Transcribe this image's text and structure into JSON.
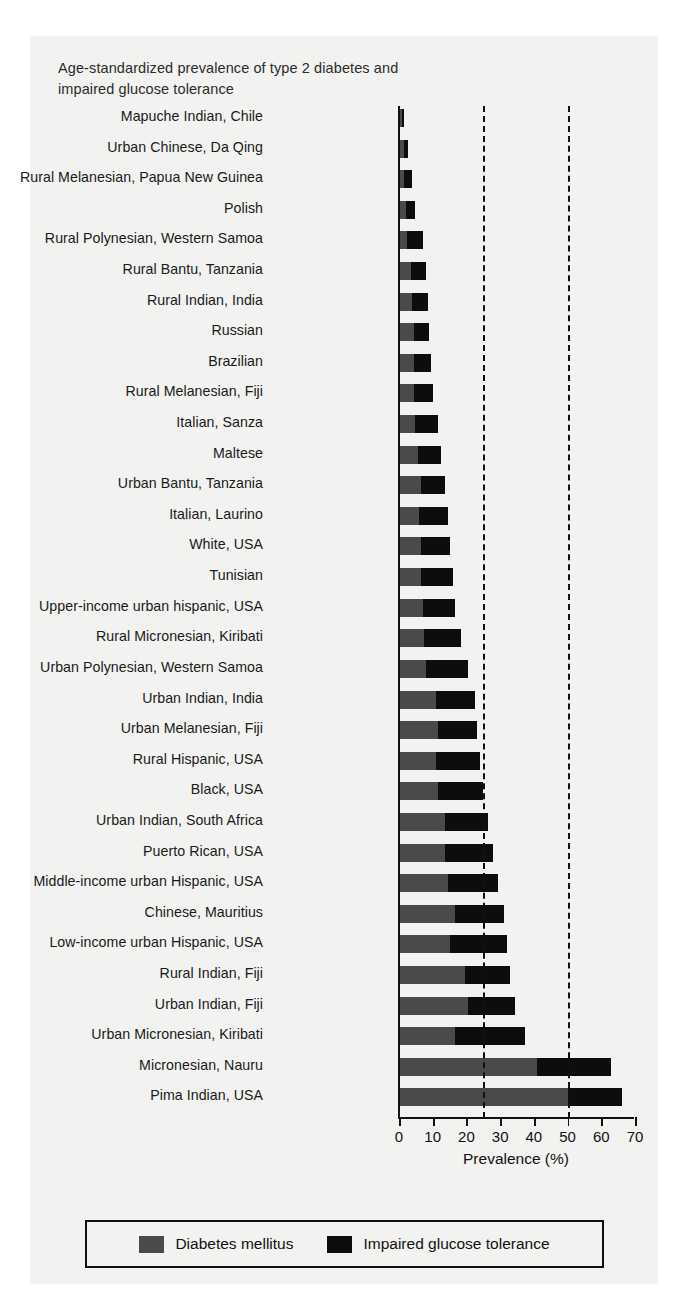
{
  "figure": {
    "title": "Age-standardized prevalence of type 2 diabetes and impaired glucose tolerance",
    "title_line1": "Age-standardized prevalence of type 2 diabetes and",
    "title_line2": "impaired glucose tolerance"
  },
  "legend": {
    "items": [
      {
        "label": "Diabetes mellitus",
        "color": "#4a4a4a",
        "swatch": "diabetes-swatch"
      },
      {
        "label": "Impaired glucose tolerance",
        "color": "#0d0d0d",
        "swatch": "igt-swatch"
      }
    ]
  },
  "chart_data": {
    "type": "bar",
    "orientation": "horizontal",
    "stacked": true,
    "title": "Age-standardized prevalence of type 2 diabetes and impaired glucose tolerance",
    "xlabel": "Prevalence (%)",
    "ylabel": "",
    "xlim": [
      0,
      70
    ],
    "xticks": [
      0,
      10,
      20,
      30,
      40,
      50,
      60,
      70
    ],
    "xtick_labels": [
      "0",
      "10",
      "20",
      "30",
      "40",
      "50",
      "60",
      "70"
    ],
    "grid": false,
    "reference_lines": [
      {
        "value": 25,
        "style": "dashed",
        "color": "#111111"
      },
      {
        "value": 50,
        "style": "dashed",
        "color": "#111111"
      }
    ],
    "legend_position": "bottom",
    "categories": [
      "Mapuche Indian, Chile",
      "Urban Chinese, Da Qing",
      "Rural Melanesian, Papua New Guinea",
      "Polish",
      "Rural Polynesian, Western Samoa",
      "Rural Bantu, Tanzania",
      "Rural Indian, India",
      "Russian",
      "Brazilian",
      "Rural Melanesian, Fiji",
      "Italian, Sanza",
      "Maltese",
      "Urban Bantu, Tanzania",
      "Italian, Laurino",
      "White, USA",
      "Tunisian",
      "Upper-income urban hispanic, USA",
      "Rural Micronesian, Kiribati",
      "Urban Polynesian, Western Samoa",
      "Urban Indian, India",
      "Urban Melanesian, Fiji",
      "Rural Hispanic, USA",
      "Black, USA",
      "Urban Indian, South Africa",
      "Puerto Rican, USA",
      "Middle-income urban Hispanic, USA",
      "Chinese, Mauritius",
      "Low-income urban Hispanic, USA",
      "Rural Indian, Fiji",
      "Urban Indian, Fiji",
      "Urban Micronesian, Kiribati",
      "Micronesian, Nauru",
      "Pima Indian, USA"
    ],
    "series": [
      {
        "name": "Diabetes mellitus",
        "color": "#4a4a4a",
        "values": [
          1.0,
          1.6,
          1.5,
          2.2,
          2.5,
          3.5,
          4.0,
          4.5,
          4.5,
          4.5,
          4.8,
          5.5,
          6.5,
          6.0,
          6.5,
          6.5,
          7.0,
          7.5,
          8.0,
          11.0,
          11.5,
          11.0,
          11.5,
          13.5,
          13.5,
          14.5,
          16.5,
          15.0,
          19.5,
          20.5,
          16.5,
          41.0,
          50.0
        ]
      },
      {
        "name": "Impaired glucose tolerance",
        "color": "#0d0d0d",
        "values": [
          0.4,
          1.0,
          2.5,
          2.5,
          4.5,
          4.5,
          4.5,
          4.5,
          5.0,
          5.5,
          6.7,
          7.0,
          7.0,
          8.5,
          8.5,
          9.5,
          9.5,
          11.0,
          12.5,
          11.5,
          11.5,
          13.0,
          13.5,
          13.0,
          14.5,
          15.0,
          14.5,
          17.0,
          13.5,
          14.0,
          21.0,
          22.0,
          16.0
        ]
      }
    ],
    "totals": [
      1.4,
      2.6,
      4.0,
      4.7,
      7.0,
      8.0,
      8.5,
      9.0,
      9.5,
      10.0,
      11.5,
      12.5,
      13.5,
      14.5,
      15.0,
      16.0,
      16.5,
      18.5,
      20.5,
      22.5,
      23.0,
      24.0,
      25.0,
      26.5,
      28.0,
      29.5,
      31.0,
      32.0,
      33.0,
      34.5,
      37.5,
      63.0,
      66.0
    ]
  }
}
